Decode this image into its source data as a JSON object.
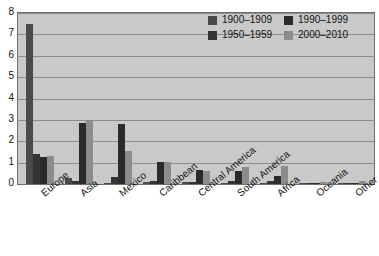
{
  "chart_data": {
    "type": "bar",
    "title": "",
    "subtitle": "",
    "xlabel": "",
    "ylabel": "",
    "ylim": [
      0,
      8
    ],
    "ytick_labels": [
      "8",
      "7",
      "6",
      "5",
      "4",
      "3",
      "2",
      "1",
      "0"
    ],
    "ytick_values": [
      8,
      7,
      6,
      5,
      4,
      3,
      2,
      1,
      0
    ],
    "grid": true,
    "legend_position": "top-right",
    "categories": [
      "Europe",
      "Asia",
      "Mexico",
      "Caribbean",
      "Central America",
      "South America",
      "Africa",
      "Oceania",
      "Other"
    ],
    "series": [
      {
        "name": "1900–1909",
        "color": "#4a4a4a",
        "values": [
          7.5,
          0.3,
          0.05,
          0.1,
          0.08,
          0.05,
          0.03,
          0.01,
          0.02
        ]
      },
      {
        "name": "1950–1959",
        "color": "#343434",
        "values": [
          1.4,
          0.15,
          0.35,
          0.12,
          0.1,
          0.15,
          0.12,
          0.02,
          0.03
        ]
      },
      {
        "name": "1990–1999",
        "color": "#2b2b2b",
        "values": [
          1.25,
          2.85,
          2.8,
          1.05,
          0.65,
          0.6,
          0.38,
          0.03,
          0.03
        ]
      },
      {
        "name": "2000–2010",
        "color": "#8c8c8c",
        "values": [
          1.3,
          3.0,
          1.55,
          1.05,
          0.6,
          0.8,
          0.85,
          0.1,
          0.15
        ]
      }
    ]
  },
  "legend": {
    "entries": [
      {
        "label": "1900–1909",
        "swatch": "s0"
      },
      {
        "label": "1990–1999",
        "swatch": "s2"
      },
      {
        "label": "1950–1959",
        "swatch": "s1"
      },
      {
        "label": "2000–2010",
        "swatch": "s3"
      }
    ]
  },
  "colors": {
    "plot_background": "#c9c9c9",
    "page_background": "#ffffff",
    "gridline": "#8d8d8d",
    "axis_border": "#6e6e6e",
    "text": "#111111"
  }
}
